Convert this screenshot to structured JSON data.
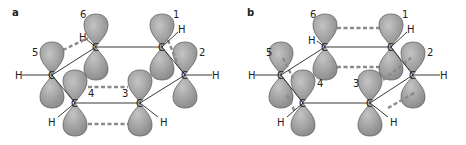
{
  "panels": [
    {
      "label": "a",
      "numbers": [
        "1",
        "2",
        "3",
        "4",
        "5",
        "6"
      ],
      "carbon": "C",
      "hydrogen": "H"
    },
    {
      "label": "b",
      "numbers": [
        "1",
        "2",
        "3",
        "4",
        "5",
        "6"
      ],
      "carbon": "C",
      "hydrogen": "H"
    }
  ],
  "colors": {
    "lobe": "#9a9a9a",
    "lobe_edge": "#555555",
    "dash": "#8a8a8a",
    "bond": "#222222"
  }
}
